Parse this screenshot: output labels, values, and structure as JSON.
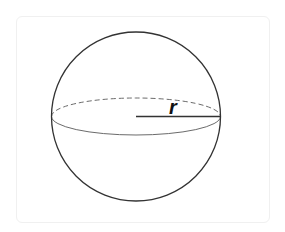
{
  "figure": {
    "shape": "sphere",
    "label": "r",
    "label_meaning": "radius",
    "sphere": {
      "cx": 136,
      "cy": 116.5,
      "r": 84.5,
      "stroke": "#333333"
    },
    "equator": {
      "rx": 84.5,
      "ry": 18.5,
      "back_style": "dashed",
      "front_style": "solid",
      "stroke": "#6b6b6b"
    },
    "radius_line": {
      "x1": 136,
      "x2": 220.5,
      "y": 116.5,
      "stroke": "#333333"
    },
    "colors": {
      "background": "#ffffff",
      "card_border": "#f0f0f0",
      "outline": "#333333",
      "equator": "#6b6b6b",
      "label": "#111111"
    }
  }
}
